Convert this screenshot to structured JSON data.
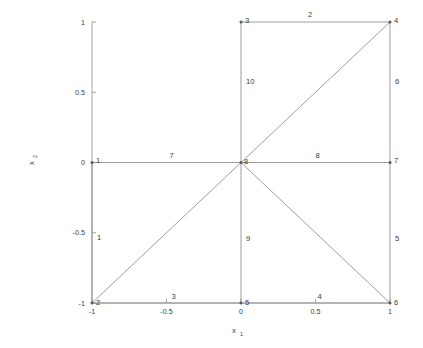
{
  "figure": {
    "background_color": "#ffffff",
    "line_color": "#8c8c8c",
    "text_color": "#3b3b3b",
    "axis_color": "#9a9a9a"
  },
  "axes": {
    "xlabel_base": "x",
    "xlabel_sub": "1",
    "ylabel_base": "x",
    "ylabel_sub": "2",
    "x_ticks": [
      "-1",
      "-0.5",
      "0",
      "0.5",
      "1"
    ],
    "y_ticks": [
      "1",
      "0.5",
      "0",
      "-0.5",
      "-1"
    ],
    "xlim": [
      -1,
      1
    ],
    "ylim": [
      -1,
      1
    ]
  },
  "chart_data": {
    "type": "scatter",
    "title": "",
    "xlabel": "x_1",
    "ylabel": "x_2",
    "xlim": [
      -1,
      1
    ],
    "ylim": [
      -1,
      1
    ],
    "x_ticks": [
      -1,
      -0.5,
      0,
      0.5,
      1
    ],
    "y_ticks": [
      -1,
      -0.5,
      0,
      0.5,
      1
    ],
    "grid": false,
    "legend": "none",
    "nodes": [
      {
        "id": "1",
        "x": -1,
        "y": 0,
        "label": "1",
        "label_dx": 4,
        "label_dy": 0
      },
      {
        "id": "2",
        "x": -1,
        "y": -1,
        "label": "2",
        "label_dx": 4,
        "label_dy": 2
      },
      {
        "id": "3",
        "x": 0,
        "y": 1,
        "label": "3",
        "label_dx": 4,
        "label_dy": 1
      },
      {
        "id": "4",
        "x": 1,
        "y": 1,
        "label": "4",
        "label_dx": 4,
        "label_dy": 1
      },
      {
        "id": "5",
        "x": 0,
        "y": -1,
        "label": "5",
        "label_dx": 4,
        "label_dy": 2
      },
      {
        "id": "6",
        "x": 1,
        "y": -1,
        "label": "6",
        "label_dx": 4,
        "label_dy": 2
      },
      {
        "id": "7",
        "x": 1,
        "y": 0,
        "label": "7",
        "label_dx": 4,
        "label_dy": 0
      },
      {
        "id": "8",
        "x": 0,
        "y": 0,
        "label": "8",
        "label_dx": 3,
        "label_dy": 1
      }
    ],
    "edges": [
      {
        "id": "1",
        "from": "1",
        "to": "2",
        "label": "1",
        "label_x": -1,
        "label_y": -0.55,
        "label_dx": 5,
        "label_dy": 0
      },
      {
        "id": "2",
        "from": "3",
        "to": "4",
        "label": "2",
        "label_x": 0.45,
        "label_y": 1,
        "label_dx": 0,
        "label_dy": -5
      },
      {
        "id": "3",
        "from": "2",
        "to": "5",
        "label": "3",
        "label_x": -0.48,
        "label_y": -1,
        "label_dx": 2,
        "label_dy": -4
      },
      {
        "id": "4",
        "from": "5",
        "to": "6",
        "label": "4",
        "label_x": 0.5,
        "label_y": -1,
        "label_dx": 2,
        "label_dy": -4
      },
      {
        "id": "5",
        "from": "6",
        "to": "7",
        "label": "5",
        "label_x": 1,
        "label_y": -0.56,
        "label_dx": 5,
        "label_dy": 0
      },
      {
        "id": "6",
        "from": "7",
        "to": "4",
        "label": "6",
        "label_x": 1,
        "label_y": 0.56,
        "label_dx": 5,
        "label_dy": 0
      },
      {
        "id": "7",
        "from": "1",
        "to": "8",
        "label": "7",
        "label_x": -0.48,
        "label_y": 0,
        "label_dx": 0,
        "label_dy": -5
      },
      {
        "id": "8",
        "from": "8",
        "to": "7",
        "label": "8",
        "label_x": 0.5,
        "label_y": 0,
        "label_dx": 0,
        "label_dy": -5
      },
      {
        "id": "9",
        "from": "8",
        "to": "5",
        "label": "9",
        "label_x": 0,
        "label_y": -0.56,
        "label_dx": 5,
        "label_dy": 0
      },
      {
        "id": "10",
        "from": "8",
        "to": "3",
        "label": "10",
        "label_x": 0,
        "label_y": 0.56,
        "label_dx": 5,
        "label_dy": 0
      }
    ],
    "diagonals": [
      {
        "from": "2",
        "to": "8"
      },
      {
        "from": "8",
        "to": "4"
      },
      {
        "from": "8",
        "to": "6"
      }
    ]
  }
}
